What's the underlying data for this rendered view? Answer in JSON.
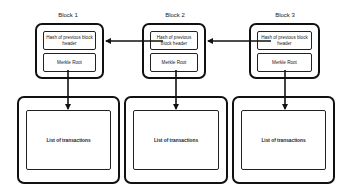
{
  "diagram": {
    "type": "blockchain-structure",
    "blocks": [
      {
        "title": "Block 1",
        "hash_field": "Hash of previous block header",
        "merkle_field": "Merkle Root",
        "transactions": "List of transactions"
      },
      {
        "title": "Block 2",
        "hash_field": "Hash of previous block header",
        "merkle_field": "Merkle Root",
        "transactions": "List of transactions"
      },
      {
        "title": "Block 3",
        "hash_field": "Hash of previous block header",
        "merkle_field": "Merkle Root",
        "transactions": "List of transactions"
      }
    ],
    "edges": [
      {
        "from": "Block 2.hash_field",
        "to": "Block 1 header",
        "style": "arrow"
      },
      {
        "from": "Block 3.hash_field",
        "to": "Block 2 header",
        "style": "arrow"
      },
      {
        "from": "Block 1.merkle_field",
        "to": "Block 1 transactions",
        "style": "arrow"
      },
      {
        "from": "Block 2.merkle_field",
        "to": "Block 2 transactions",
        "style": "arrow"
      },
      {
        "from": "Block 3.merkle_field",
        "to": "Block 3 transactions",
        "style": "arrow"
      }
    ],
    "colors": {
      "stroke": "#111111",
      "background": "#ffffff"
    }
  }
}
